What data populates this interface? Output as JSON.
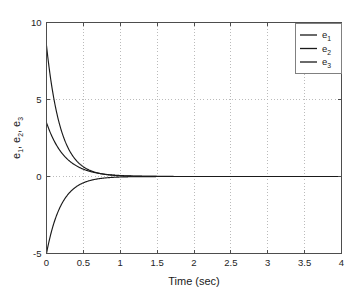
{
  "chart_data": {
    "type": "line",
    "title": "",
    "xlabel": "Time (sec)",
    "ylabel": "e_1, e_2, e_3",
    "xlim": [
      0,
      4
    ],
    "ylim": [
      -5,
      10
    ],
    "grid": true,
    "legend_position": "top-right",
    "xticks": [
      0,
      0.5,
      1,
      1.5,
      2,
      2.5,
      3,
      3.5,
      4
    ],
    "xtick_labels": [
      "0",
      "0.5",
      "1",
      "1.5",
      "2",
      "2.5",
      "3",
      "3.5",
      "4"
    ],
    "yticks": [
      -5,
      0,
      5,
      10
    ],
    "ytick_labels": [
      "-5",
      "0",
      "5",
      "10"
    ],
    "series": [
      {
        "name": "e_1",
        "label_base": "e",
        "label_sub": "1",
        "color": "#1a1a1a",
        "initial_value": 8.5,
        "final_value": 0,
        "decay_rate": 5.2,
        "x": [
          0,
          0.05,
          0.1,
          0.15,
          0.2,
          0.25,
          0.3,
          0.35,
          0.4,
          0.45,
          0.5,
          0.55,
          0.6,
          0.7,
          0.8,
          0.9,
          1.0,
          1.2,
          1.5,
          2.0,
          2.5,
          3.0,
          3.5,
          4.0
        ],
        "values": [
          8.5,
          6.55,
          5.05,
          3.9,
          3.0,
          2.31,
          1.78,
          1.37,
          1.06,
          0.82,
          0.63,
          0.48,
          0.37,
          0.22,
          0.13,
          0.08,
          0.05,
          0.02,
          0.0,
          0.0,
          0.0,
          0.0,
          0.0,
          0.0
        ]
      },
      {
        "name": "e_2",
        "label_base": "e",
        "label_sub": "2",
        "color": "#1a1a1a",
        "initial_value": 3.5,
        "final_value": 0,
        "decay_rate": 4.0,
        "x": [
          0,
          0.05,
          0.1,
          0.15,
          0.2,
          0.25,
          0.3,
          0.35,
          0.4,
          0.45,
          0.5,
          0.55,
          0.6,
          0.7,
          0.8,
          0.9,
          1.0,
          1.2,
          1.5,
          2.0,
          2.5,
          3.0,
          3.5,
          4.0
        ],
        "values": [
          3.5,
          2.87,
          2.35,
          1.92,
          1.57,
          1.29,
          1.05,
          0.86,
          0.71,
          0.58,
          0.47,
          0.39,
          0.32,
          0.21,
          0.14,
          0.1,
          0.06,
          0.03,
          0.01,
          0.0,
          0.0,
          0.0,
          0.0,
          0.0
        ]
      },
      {
        "name": "e_3",
        "label_base": "e",
        "label_sub": "3",
        "color": "#1a1a1a",
        "initial_value": -5.0,
        "final_value": 0,
        "decay_rate": 5.0,
        "x": [
          0,
          0.05,
          0.1,
          0.15,
          0.2,
          0.25,
          0.3,
          0.35,
          0.4,
          0.45,
          0.5,
          0.55,
          0.6,
          0.7,
          0.8,
          0.9,
          1.0,
          1.2,
          1.5,
          2.0,
          2.5,
          3.0,
          3.5,
          4.0
        ],
        "values": [
          -5.0,
          -3.9,
          -3.03,
          -2.36,
          -1.84,
          -1.43,
          -1.12,
          -0.87,
          -0.68,
          -0.53,
          -0.41,
          -0.32,
          -0.25,
          -0.15,
          -0.09,
          -0.06,
          -0.03,
          -0.01,
          0.0,
          0.0,
          0.0,
          0.0,
          0.0,
          0.0
        ]
      }
    ]
  }
}
